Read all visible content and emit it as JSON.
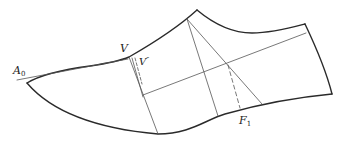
{
  "diagram": {
    "type": "shoe-last pattern drawing",
    "labels": {
      "a0": {
        "main": "A",
        "sub": "0"
      },
      "v": {
        "main": "V"
      },
      "v_prime": {
        "main": "V",
        "sup": "″"
      },
      "f1": {
        "main": "F",
        "sub": "1"
      }
    },
    "colors": {
      "outline": "#2a2a2a",
      "construction": "#555555",
      "background": "#ffffff"
    }
  }
}
